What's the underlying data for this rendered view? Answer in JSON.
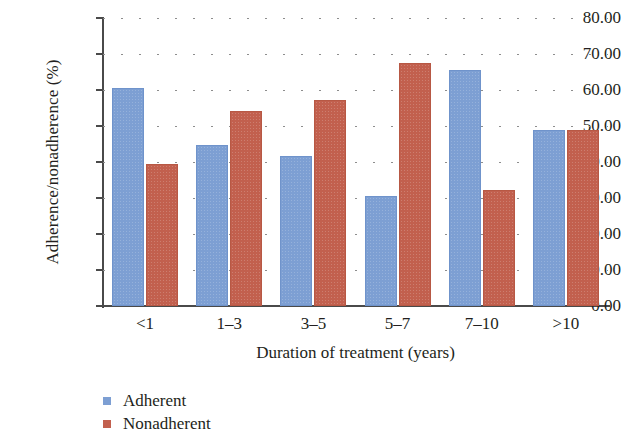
{
  "chart_data": {
    "type": "bar",
    "title": "",
    "xlabel": "Duration of treatment (years)",
    "ylabel": "Adherence/nonadherence (%)",
    "categories": [
      "<1",
      "1–3",
      "3–5",
      "5–7",
      "7–10",
      ">10"
    ],
    "series": [
      {
        "name": "Adherent",
        "color": "#7d9fd3",
        "values": [
          60.6,
          44.7,
          41.7,
          30.6,
          65.6,
          48.8
        ]
      },
      {
        "name": "Nonadherent",
        "color": "#c2604e",
        "values": [
          39.4,
          54.3,
          57.2,
          67.5,
          32.1,
          48.9
        ]
      }
    ],
    "ylim": [
      0,
      80
    ],
    "ytick_labels": [
      "0.00",
      "10.00",
      "20.00",
      "30.00",
      "40.00",
      "50.00",
      "60.00",
      "70.00",
      "80.00"
    ],
    "ytick_values": [
      0,
      10,
      20,
      30,
      40,
      50,
      60,
      70,
      80
    ],
    "grid": "horizontal-dotted",
    "legend_position": "bottom-left",
    "legend": [
      "Adherent",
      "Nonadherent"
    ]
  },
  "axes": {
    "y_title": "Adherence/nonadherence (%)",
    "x_title": "Duration of treatment (years)"
  }
}
